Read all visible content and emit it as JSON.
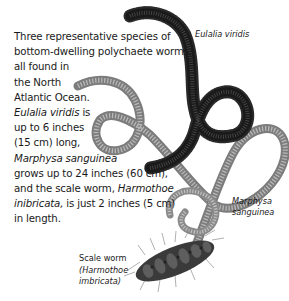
{
  "caption": {
    "lines": [
      "Three representative species of",
      "bottom-dwelling polychaete worms,",
      "all found in",
      "the North",
      "Atlantic Ocean."
    ],
    "eulalia_name": "Eulalia viridis",
    "eulalia_rest": " is",
    "eulalia_size_line1": "up to 6 inches",
    "eulalia_size_line2": "(15 cm) long,",
    "marphysa_name": "Marphysa sanguinea",
    "marphysa_size": "grows up to 24 inches (60 cm),",
    "scale_intro": "and the scale worm, ",
    "harmothoe_name1": "Harmothoe",
    "harmothoe_name2": "inibricata,",
    "scale_size": " is just 2 inches (5 cm)",
    "scale_end": "in length."
  },
  "labels": {
    "eulalia": "Eulalia viridis",
    "marphysa_line1": "Marphysa",
    "marphysa_line2": "sanguinea",
    "scale_common": "Scale worm",
    "scale_latin_line1": "(Harmothoe",
    "scale_latin_line2": "imbricata)"
  },
  "illustrations": {
    "eulalia_color": "#1c1c1c",
    "marphysa_color": "#8a8a8a",
    "scale_worm_color": "#3a3a3a"
  }
}
